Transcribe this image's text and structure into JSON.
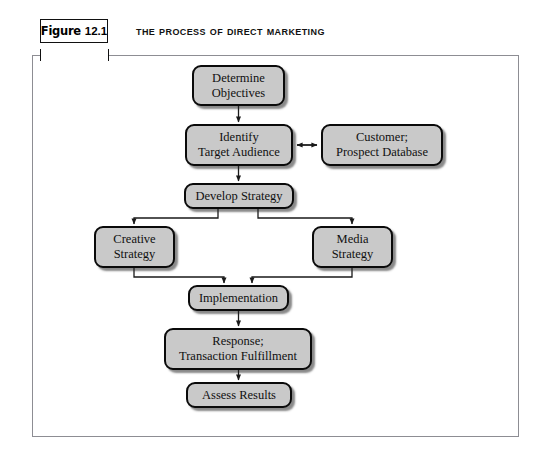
{
  "figure": {
    "label_word": "Figure",
    "label_number": "12.1",
    "title": "The Process of Direct Marketing"
  },
  "colors": {
    "node_fill": "#c9c9c9",
    "node_border": "#0a0a0a",
    "frame_border": "#8d8d93",
    "arrow": "#1a1a1a",
    "page_background": "#ffffff"
  },
  "diagram": {
    "type": "flowchart",
    "orientation": "top-to-bottom",
    "nodes": [
      {
        "id": "determine-objectives",
        "label": "Determine\nObjectives",
        "x": 192,
        "y": 65,
        "w": 93,
        "h": 41
      },
      {
        "id": "identify-target-audience",
        "label": "Identify\nTarget Audience",
        "x": 185,
        "y": 124,
        "w": 108,
        "h": 42
      },
      {
        "id": "customer-prospect-database",
        "label": "Customer;\nProspect Database",
        "x": 321,
        "y": 124,
        "w": 122,
        "h": 42
      },
      {
        "id": "develop-strategy",
        "label": "Develop Strategy",
        "x": 184,
        "y": 183,
        "w": 110,
        "h": 26
      },
      {
        "id": "creative-strategy",
        "label": "Creative\nStrategy",
        "x": 94,
        "y": 226,
        "w": 81,
        "h": 42
      },
      {
        "id": "media-strategy",
        "label": "Media\nStrategy",
        "x": 312,
        "y": 226,
        "w": 81,
        "h": 42
      },
      {
        "id": "implementation",
        "label": "Implementation",
        "x": 188,
        "y": 285,
        "w": 101,
        "h": 26
      },
      {
        "id": "response-transaction-fulfillment",
        "label": "Response;\nTransaction Fulfillment",
        "x": 164,
        "y": 328,
        "w": 148,
        "h": 42
      },
      {
        "id": "assess-results",
        "label": "Assess Results",
        "x": 186,
        "y": 382,
        "w": 106,
        "h": 26
      }
    ],
    "edges": [
      {
        "from": "determine-objectives",
        "to": "identify-target-audience",
        "kind": "arrow-down"
      },
      {
        "from": "identify-target-audience",
        "to": "customer-prospect-database",
        "kind": "arrow-bidirectional"
      },
      {
        "from": "identify-target-audience",
        "to": "develop-strategy",
        "kind": "arrow-down"
      },
      {
        "from": "develop-strategy",
        "to": "creative-strategy",
        "kind": "elbow-left-down"
      },
      {
        "from": "develop-strategy",
        "to": "media-strategy",
        "kind": "elbow-right-down"
      },
      {
        "from": "creative-strategy",
        "to": "implementation",
        "kind": "elbow-down-right"
      },
      {
        "from": "media-strategy",
        "to": "implementation",
        "kind": "elbow-down-left"
      },
      {
        "from": "implementation",
        "to": "response-transaction-fulfillment",
        "kind": "arrow-down"
      },
      {
        "from": "response-transaction-fulfillment",
        "to": "assess-results",
        "kind": "arrow-down"
      }
    ]
  }
}
